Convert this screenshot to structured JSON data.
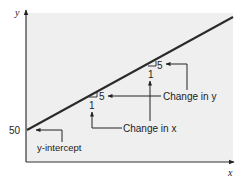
{
  "diagram": {
    "type": "slope-intercept-graph",
    "axes": {
      "x_label": "x",
      "y_label": "y"
    },
    "line": {
      "y_intercept_value": "50",
      "slope_rise": "5",
      "slope_run": "1"
    },
    "triangles": [
      {
        "rise_label": "5",
        "run_label": "1"
      },
      {
        "rise_label": "5",
        "run_label": "1"
      }
    ],
    "annotations": {
      "y_intercept_prefix": "y",
      "y_intercept_suffix": "-intercept",
      "change_in_x_prefix": "Change in ",
      "change_in_x_var": "x",
      "change_in_y_prefix": "Change in ",
      "change_in_y_var": "y"
    },
    "colors": {
      "plot_background": "#efefef",
      "line": "#2a2a2a",
      "axis": "#333333",
      "text": "#222222"
    }
  }
}
